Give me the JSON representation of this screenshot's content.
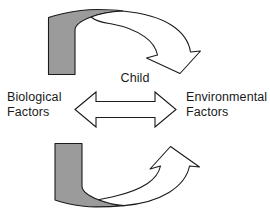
{
  "diagram": {
    "center_label": "Child",
    "left_label": {
      "line1": "Biological",
      "line2": "Factors"
    },
    "right_label": {
      "line1": "Environmental",
      "line2": "Factors"
    },
    "shapes": {
      "top_arc_arrow": "top-curved-arrow-pointing-right-down",
      "bottom_arc_arrow": "bottom-curved-arrow-pointing-right-up",
      "center_arrow": "double-headed-horizontal-arrow"
    },
    "colors": {
      "shaded_fill": "#9b9b9b",
      "unshaded_fill": "#ffffff",
      "stroke": "#1a1a1a",
      "text": "#1a1a1a",
      "background": "#ffffff"
    }
  }
}
